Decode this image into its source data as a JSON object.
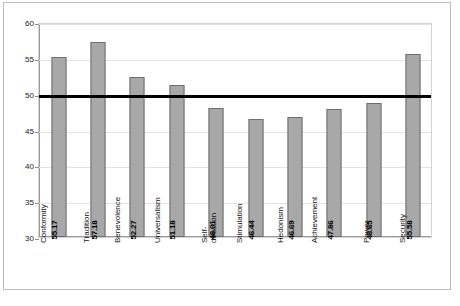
{
  "figure": {
    "caption": ""
  },
  "chart_data": {
    "type": "bar",
    "title": "",
    "subtitle": "",
    "xlabel": "",
    "ylabel": "",
    "categories": [
      "Conformity",
      "Tradition",
      "Benevolence",
      "Universalism",
      "Self-\ndirection",
      "Stimulation",
      "Hedonism",
      "Achievement",
      "Power",
      "Security"
    ],
    "values": [
      55.17,
      57.18,
      52.27,
      51.18,
      48.01,
      46.44,
      46.69,
      47.86,
      48.65,
      55.58
    ],
    "data_labels": [
      "55.17",
      "57.18",
      "52.27",
      "51.18",
      "48.01",
      "46.44",
      "46.69",
      "47.86",
      "48.65",
      "55.58"
    ],
    "ylim": [
      30,
      60
    ],
    "yticks": [
      30,
      35,
      40,
      45,
      50,
      55,
      60
    ],
    "ytick_labels": [
      "30",
      "35",
      "40",
      "45",
      "50",
      "55",
      "60"
    ],
    "grid": true,
    "legend": false,
    "reference_line": {
      "value": 50,
      "color": "#000000",
      "label": ""
    },
    "colors": {
      "bar_fill": "#a8a8a8",
      "bar_edge": "#6e6e6e",
      "gridline": "#e2e2e2",
      "axis": "#9a9a9a",
      "frame": "#bdbdbd",
      "text": "#111111"
    }
  }
}
